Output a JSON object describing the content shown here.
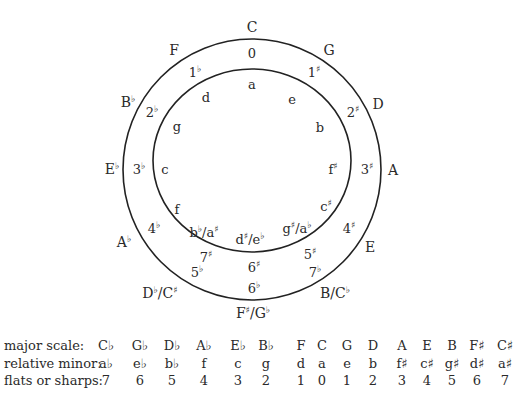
{
  "diagram": {
    "outer_circle": {
      "cx": 252,
      "cy": 169.5,
      "rx": 129,
      "ry": 130.5
    },
    "inner_circle": {
      "cx": 252,
      "cy": 160.5,
      "rx": 99,
      "ry": 91.5
    },
    "line_color": "#222222",
    "major_keys": [
      {
        "key": "C",
        "base": "C",
        "acc": "",
        "x": 252,
        "y": 27
      },
      {
        "key": "G",
        "base": "G",
        "acc": "",
        "x": 329,
        "y": 50
      },
      {
        "key": "D",
        "base": "D",
        "acc": "",
        "x": 378,
        "y": 104
      },
      {
        "key": "A",
        "base": "A",
        "acc": "",
        "x": 393,
        "y": 170
      },
      {
        "key": "E",
        "base": "E",
        "acc": "",
        "x": 370,
        "y": 247
      },
      {
        "key": "B/C♭",
        "base": "B/C",
        "acc": "♭",
        "x": 335,
        "y": 293
      },
      {
        "key": "F♯/G♭",
        "base": "F",
        "acc": "♯",
        "rest": "/G",
        "acc2": "♭",
        "x": 253,
        "y": 313
      },
      {
        "key": "D♭/C♯",
        "base": "D",
        "acc": "♭",
        "rest": "/C",
        "acc2": "♯",
        "x": 160,
        "y": 293
      },
      {
        "key": "A♭",
        "base": "A",
        "acc": "♭",
        "x": 124,
        "y": 242
      },
      {
        "key": "E♭",
        "base": "E",
        "acc": "♭",
        "x": 112,
        "y": 169
      },
      {
        "key": "B♭",
        "base": "B",
        "acc": "♭",
        "x": 128,
        "y": 102
      },
      {
        "key": "F",
        "base": "F",
        "acc": "",
        "x": 174,
        "y": 50
      }
    ],
    "accidental_counts": [
      {
        "label": "0",
        "base": "0",
        "acc": "",
        "x": 252,
        "y": 53
      },
      {
        "label": "1♯",
        "base": "1",
        "acc": "♯",
        "x": 314,
        "y": 72
      },
      {
        "label": "2♯",
        "base": "2",
        "acc": "♯",
        "x": 353,
        "y": 112
      },
      {
        "label": "3♯",
        "base": "3",
        "acc": "♯",
        "x": 367,
        "y": 169
      },
      {
        "label": "4♯",
        "base": "4",
        "acc": "♯",
        "x": 349,
        "y": 228
      },
      {
        "label": "5♯",
        "base": "5",
        "acc": "♯",
        "x": 310,
        "y": 254
      },
      {
        "label": "7♭",
        "base": "7",
        "acc": "♭",
        "x": 315,
        "y": 272
      },
      {
        "label": "6♯",
        "base": "6",
        "acc": "♯",
        "x": 254,
        "y": 267
      },
      {
        "label": "6♭",
        "base": "6",
        "acc": "♭",
        "x": 254,
        "y": 288
      },
      {
        "label": "7♯",
        "base": "7",
        "acc": "♯",
        "x": 206,
        "y": 257
      },
      {
        "label": "5♭",
        "base": "5",
        "acc": "♭",
        "x": 197,
        "y": 272
      },
      {
        "label": "4♭",
        "base": "4",
        "acc": "♭",
        "x": 154,
        "y": 228
      },
      {
        "label": "3♭",
        "base": "3",
        "acc": "♭",
        "x": 139,
        "y": 169
      },
      {
        "label": "2♭",
        "base": "2",
        "acc": "♭",
        "x": 152,
        "y": 112
      },
      {
        "label": "1♭",
        "base": "1",
        "acc": "♭",
        "x": 195,
        "y": 72
      }
    ],
    "minor_keys": [
      {
        "key": "a",
        "base": "a",
        "acc": "",
        "x": 252,
        "y": 84
      },
      {
        "key": "e",
        "base": "e",
        "acc": "",
        "x": 292,
        "y": 99
      },
      {
        "key": "b",
        "base": "b",
        "acc": "",
        "x": 320,
        "y": 127
      },
      {
        "key": "f♯",
        "base": "f",
        "acc": "♯",
        "x": 333,
        "y": 169
      },
      {
        "key": "c♯",
        "base": "c",
        "acc": "♯",
        "x": 326,
        "y": 206
      },
      {
        "key": "g♯/a♭",
        "base": "g",
        "acc": "♯",
        "rest": "/a",
        "acc2": "♭",
        "x": 297,
        "y": 228
      },
      {
        "key": "d♯/e♭",
        "base": "d",
        "acc": "♯",
        "rest": "/e",
        "acc2": "♭",
        "x": 250,
        "y": 239
      },
      {
        "key": "b♭/a♯",
        "base": "b",
        "acc": "♭",
        "rest": "/a",
        "acc2": "♯",
        "x": 204,
        "y": 232
      },
      {
        "key": "f",
        "base": "f",
        "acc": "",
        "x": 177,
        "y": 209
      },
      {
        "key": "c",
        "base": "c",
        "acc": "",
        "x": 165,
        "y": 169
      },
      {
        "key": "g",
        "base": "g",
        "acc": "",
        "x": 177,
        "y": 126
      },
      {
        "key": "d",
        "base": "d",
        "acc": "",
        "x": 206,
        "y": 97
      }
    ]
  },
  "table": {
    "columns_x": [
      106,
      140,
      172,
      204,
      238,
      266,
      301,
      322,
      347,
      373,
      402,
      427,
      452,
      477,
      505
    ],
    "rows": [
      {
        "header": "major scale:",
        "y": 0,
        "cells": [
          "C♭",
          "G♭",
          "D♭",
          "A♭",
          "E♭",
          "B♭",
          "F",
          "C",
          "G",
          "D",
          "A",
          "E",
          "B",
          "F♯",
          "C♯"
        ]
      },
      {
        "header": "relative minor:",
        "y": 18,
        "cells": [
          "a♭",
          "e♭",
          "b♭",
          "f",
          "c",
          "g",
          "d",
          "a",
          "e",
          "b",
          "f♯",
          "c♯",
          "g♯",
          "d♯",
          "a♯"
        ]
      },
      {
        "header": "flats or sharps:",
        "y": 35,
        "cells": [
          "7",
          "6",
          "5",
          "4",
          "3",
          "2",
          "1",
          "0",
          "1",
          "2",
          "3",
          "4",
          "5",
          "6",
          "7"
        ]
      }
    ]
  }
}
